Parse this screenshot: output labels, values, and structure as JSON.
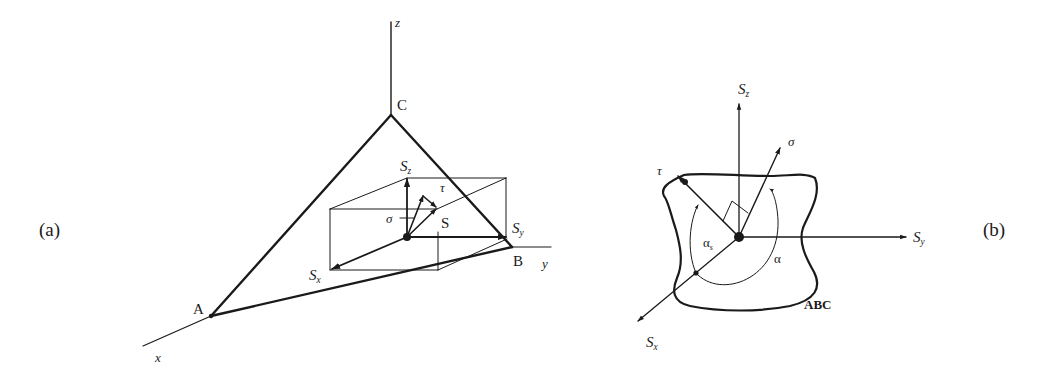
{
  "figure": {
    "panels": [
      {
        "id": "a",
        "label": "(a)",
        "axes": {
          "x": "x",
          "y": "y",
          "z": "z"
        },
        "points": {
          "A": "A",
          "B": "B",
          "C": "C"
        },
        "vectors": {
          "Sx": {
            "base": "S",
            "sub": "x"
          },
          "Sy": {
            "base": "S",
            "sub": "y"
          },
          "Sz": {
            "base": "S",
            "sub": "z"
          },
          "S": "S",
          "sigma": "σ",
          "tau": "τ"
        }
      },
      {
        "id": "b",
        "label": "(b)",
        "plane_label": "ABC",
        "vectors": {
          "Sx": {
            "base": "S",
            "sub": "x"
          },
          "Sy": {
            "base": "S",
            "sub": "y"
          },
          "Sz": {
            "base": "S",
            "sub": "z"
          },
          "sigma": "σ",
          "tau": "τ"
        },
        "angles": {
          "alpha": "α",
          "alpha_s": {
            "base": "α",
            "sub": "s"
          }
        }
      }
    ],
    "colors": {
      "ink": "#1a1a1a",
      "background": "#ffffff"
    }
  }
}
